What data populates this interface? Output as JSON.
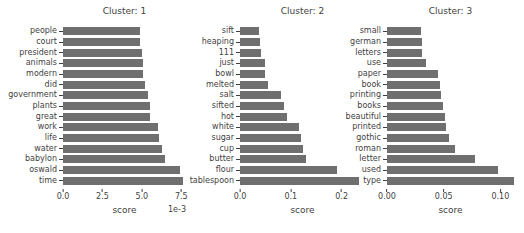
{
  "figure": {
    "background": "#ffffff",
    "bar_color": "#6f6f6f",
    "text_color": "#3f3f3f"
  },
  "chart_data": [
    {
      "type": "bar",
      "orientation": "horizontal",
      "title": "Cluster: 1",
      "xlabel": "score",
      "offset_label": "1e-3",
      "legend": "none",
      "grid": false,
      "categories": [
        "people",
        "court",
        "president",
        "animals",
        "modern",
        "did",
        "government",
        "plants",
        "great",
        "work",
        "life",
        "water",
        "babylon",
        "oswald",
        "time"
      ],
      "values": [
        0.0049,
        0.0049,
        0.005,
        0.0051,
        0.0051,
        0.0052,
        0.0054,
        0.0055,
        0.0055,
        0.006,
        0.0061,
        0.0063,
        0.0065,
        0.0074,
        0.0076
      ],
      "xlim": [
        0,
        0.0078
      ],
      "xticks": [
        {
          "label": "0.0",
          "value": 0
        },
        {
          "label": "2.5",
          "value": 0.0025
        },
        {
          "label": "5.0",
          "value": 0.005
        },
        {
          "label": "7.5",
          "value": 0.0075
        }
      ]
    },
    {
      "type": "bar",
      "orientation": "horizontal",
      "title": "Cluster: 2",
      "xlabel": "score",
      "offset_label": "",
      "legend": "none",
      "grid": false,
      "categories": [
        "sift",
        "heaping",
        "111",
        "just",
        "bowl",
        "melted",
        "salt",
        "sifted",
        "hot",
        "white",
        "sugar",
        "cup",
        "butter",
        "flour",
        "tablespoon"
      ],
      "values": [
        0.038,
        0.039,
        0.041,
        0.05,
        0.05,
        0.056,
        0.081,
        0.087,
        0.092,
        0.117,
        0.121,
        0.123,
        0.13,
        0.19,
        0.235
      ],
      "xlim": [
        0,
        0.246
      ],
      "xticks": [
        {
          "label": "0.0",
          "value": 0
        },
        {
          "label": "0.1",
          "value": 0.1
        },
        {
          "label": "0.2",
          "value": 0.2
        }
      ]
    },
    {
      "type": "bar",
      "orientation": "horizontal",
      "title": "Cluster: 3",
      "xlabel": "score",
      "offset_label": "",
      "legend": "none",
      "grid": false,
      "categories": [
        "small",
        "german",
        "letters",
        "use",
        "paper",
        "book",
        "printing",
        "books",
        "beautiful",
        "printed",
        "gothic",
        "roman",
        "letter",
        "used",
        "type"
      ],
      "values": [
        0.03,
        0.031,
        0.031,
        0.034,
        0.045,
        0.047,
        0.048,
        0.049,
        0.051,
        0.052,
        0.055,
        0.06,
        0.078,
        0.098,
        0.112
      ],
      "xlim": [
        0,
        0.112
      ],
      "xticks": [
        {
          "label": "0.00",
          "value": 0
        },
        {
          "label": "0.05",
          "value": 0.05
        },
        {
          "label": "0.10",
          "value": 0.1
        }
      ]
    }
  ]
}
